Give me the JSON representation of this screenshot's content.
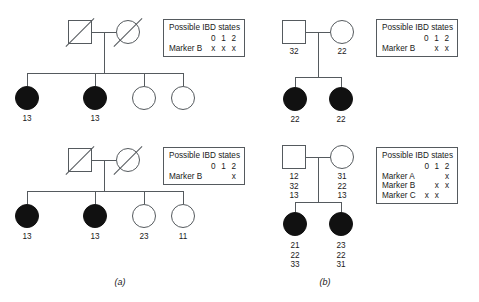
{
  "figure": {
    "panels": [
      {
        "id": "a",
        "caption": "(a)",
        "pedigrees": [
          {
            "id": "a-top",
            "parents": [
              {
                "role": "father",
                "shape": "square",
                "affected": false,
                "deceased": true,
                "genotype": ""
              },
              {
                "role": "mother",
                "shape": "circle",
                "affected": false,
                "deceased": true,
                "genotype": ""
              }
            ],
            "children": [
              {
                "shape": "circle",
                "affected": true,
                "genotype": "13"
              },
              {
                "shape": "circle",
                "affected": true,
                "genotype": "13"
              },
              {
                "shape": "circle",
                "affected": false,
                "genotype": ""
              },
              {
                "shape": "circle",
                "affected": false,
                "genotype": ""
              }
            ],
            "ibd": {
              "title": "Possible IBD states",
              "columns": [
                "0",
                "1",
                "2"
              ],
              "rows": [
                {
                  "marker": "Marker B",
                  "states": [
                    "x",
                    "x",
                    "x"
                  ]
                }
              ]
            }
          },
          {
            "id": "a-bottom",
            "parents": [
              {
                "role": "father",
                "shape": "square",
                "affected": false,
                "deceased": true,
                "genotype": ""
              },
              {
                "role": "mother",
                "shape": "circle",
                "affected": false,
                "deceased": true,
                "genotype": ""
              }
            ],
            "children": [
              {
                "shape": "circle",
                "affected": true,
                "genotype": "13"
              },
              {
                "shape": "circle",
                "affected": true,
                "genotype": "13"
              },
              {
                "shape": "circle",
                "affected": false,
                "genotype": "23"
              },
              {
                "shape": "circle",
                "affected": false,
                "genotype": "11"
              }
            ],
            "ibd": {
              "title": "Possible IBD states",
              "columns": [
                "0",
                "1",
                "2"
              ],
              "rows": [
                {
                  "marker": "Marker B",
                  "states": [
                    "",
                    "",
                    "x"
                  ]
                }
              ]
            }
          }
        ]
      },
      {
        "id": "b",
        "caption": "(b)",
        "pedigrees": [
          {
            "id": "b-top",
            "parents": [
              {
                "role": "father",
                "shape": "square",
                "affected": false,
                "deceased": false,
                "genotype": "32"
              },
              {
                "role": "mother",
                "shape": "circle",
                "affected": false,
                "deceased": false,
                "genotype": "22"
              }
            ],
            "children": [
              {
                "shape": "circle",
                "affected": true,
                "genotype": "22"
              },
              {
                "shape": "circle",
                "affected": true,
                "genotype": "22"
              }
            ],
            "ibd": {
              "title": "Possible IBD states",
              "columns": [
                "0",
                "1",
                "2"
              ],
              "rows": [
                {
                  "marker": "Marker B",
                  "states": [
                    "",
                    "x",
                    "x"
                  ]
                }
              ]
            }
          },
          {
            "id": "b-bottom",
            "parents": [
              {
                "role": "father",
                "shape": "square",
                "affected": false,
                "deceased": false,
                "genotype": "12\n32\n13"
              },
              {
                "role": "mother",
                "shape": "circle",
                "affected": false,
                "deceased": false,
                "genotype": "31\n22\n13"
              }
            ],
            "children": [
              {
                "shape": "circle",
                "affected": true,
                "genotype": "21\n22\n33"
              },
              {
                "shape": "circle",
                "affected": true,
                "genotype": "23\n22\n31"
              }
            ],
            "ibd": {
              "title": "Possible IBD states",
              "columns": [
                "0",
                "1",
                "2"
              ],
              "rows": [
                {
                  "marker": "Marker A",
                  "states": [
                    "",
                    "",
                    "x"
                  ]
                },
                {
                  "marker": "Marker B",
                  "states": [
                    "",
                    "x",
                    "x"
                  ]
                },
                {
                  "marker": "Marker C",
                  "states": [
                    "x",
                    "x",
                    ""
                  ]
                }
              ]
            }
          }
        ]
      }
    ]
  }
}
